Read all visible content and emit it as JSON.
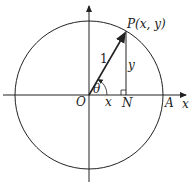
{
  "diagram": {
    "labels": {
      "point": "P(x, y)",
      "origin": "O",
      "foot": "N",
      "axis_point": "A",
      "x_axis": "x",
      "angle": "θ",
      "radius": "1",
      "adjacent": "x",
      "opposite": "y"
    },
    "colors": {
      "stroke": "#222222",
      "background": "#ffffff"
    }
  }
}
